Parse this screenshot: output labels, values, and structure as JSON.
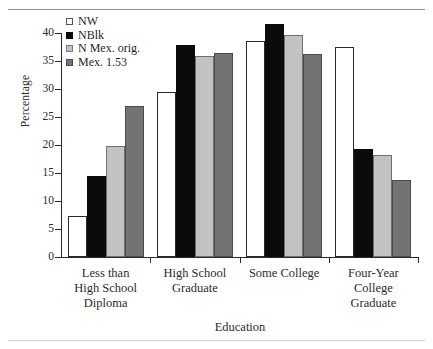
{
  "chart_data": {
    "type": "bar",
    "title": "",
    "xlabel": "Education",
    "ylabel": "Percentage",
    "ylim": [
      0,
      40
    ],
    "yticks": [
      0,
      5,
      10,
      15,
      20,
      25,
      30,
      35,
      40
    ],
    "ytick_labels": [
      "0",
      "5",
      "10",
      "15",
      "20",
      "25",
      "30",
      "35",
      "40"
    ],
    "grid": false,
    "legend_position": "top-left",
    "categories": [
      "Less than\nHigh School\nDiploma",
      "High School\nGraduate",
      "Some College",
      "Four-Year\nCollege\nGraduate"
    ],
    "category_lines": [
      [
        "Less than",
        "High School",
        "Diploma"
      ],
      [
        "High School",
        "Graduate"
      ],
      [
        "Some College"
      ],
      [
        "Four-Year",
        "College",
        "Graduate"
      ]
    ],
    "series": [
      {
        "name": "NW",
        "color": "#ffffff",
        "edge": "#2a2a2a",
        "values": [
          7.4,
          29.5,
          38.6,
          37.5
        ]
      },
      {
        "name": "NBlk",
        "color": "#0b0b0b",
        "edge": "#0b0b0b",
        "values": [
          14.5,
          37.9,
          41.6,
          19.3
        ]
      },
      {
        "name": "N Mex. orig.",
        "color": "#c2c2c2",
        "edge": "#6f6f6f",
        "values": [
          19.9,
          35.9,
          39.6,
          18.3
        ]
      },
      {
        "name": "Mex. 1.53",
        "color": "#737373",
        "edge": "#4a4a4a",
        "values": [
          26.9,
          36.4,
          36.3,
          13.7
        ]
      }
    ]
  },
  "legend": {
    "entries": [
      {
        "label": "NW"
      },
      {
        "label": "NBlk"
      },
      {
        "label": "N Mex. orig."
      },
      {
        "label": "Mex. 1.53"
      }
    ]
  }
}
